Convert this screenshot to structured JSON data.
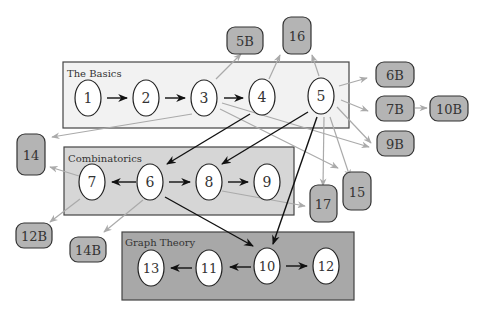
{
  "colors": {
    "basics_fill": "#f2f2f2",
    "combinatorics_fill": "#d6d6d6",
    "graph_theory_fill": "#a8a8a8",
    "external_box_fill": "#b4b4b4",
    "node_fill": "#ffffff",
    "strong_edge": "#111111",
    "weak_edge": "#aaaaaa"
  },
  "groups": [
    {
      "id": "basics",
      "label": "The Basics"
    },
    {
      "id": "combinatorics",
      "label": "Combinatorics"
    },
    {
      "id": "graph_theory",
      "label": "Graph Theory"
    }
  ],
  "nodes": {
    "n1": "1",
    "n2": "2",
    "n3": "3",
    "n4": "4",
    "n5": "5",
    "n6": "6",
    "n7": "7",
    "n8": "8",
    "n9": "9",
    "n10": "10",
    "n11": "11",
    "n12": "12",
    "n13": "13"
  },
  "external": {
    "e5B": "5B",
    "e16": "16",
    "e6B": "6B",
    "e7B": "7B",
    "e10B": "10B",
    "e9B": "9B",
    "e14": "14",
    "e17": "17",
    "e15": "15",
    "e12B": "12B",
    "e14B": "14B"
  },
  "edges": {
    "strong": [
      [
        "1",
        "2"
      ],
      [
        "2",
        "3"
      ],
      [
        "3",
        "4"
      ],
      [
        "4",
        "6"
      ],
      [
        "5",
        "8"
      ],
      [
        "5",
        "10"
      ],
      [
        "6",
        "7"
      ],
      [
        "6",
        "8"
      ],
      [
        "8",
        "9"
      ],
      [
        "6",
        "10"
      ],
      [
        "10",
        "11"
      ],
      [
        "11",
        "13"
      ],
      [
        "10",
        "12"
      ]
    ],
    "weak": [
      [
        "3",
        "5B"
      ],
      [
        "4",
        "16"
      ],
      [
        "5",
        "16"
      ],
      [
        "5",
        "6B"
      ],
      [
        "5",
        "7B"
      ],
      [
        "5",
        "9B"
      ],
      [
        "5",
        "17"
      ],
      [
        "5",
        "15"
      ],
      [
        "3",
        "14"
      ],
      [
        "3",
        "9B"
      ],
      [
        "3",
        "15"
      ],
      [
        "7B",
        "10B"
      ],
      [
        "7",
        "14"
      ],
      [
        "7",
        "12B"
      ],
      [
        "6",
        "14B"
      ],
      [
        "8",
        "17"
      ]
    ]
  }
}
